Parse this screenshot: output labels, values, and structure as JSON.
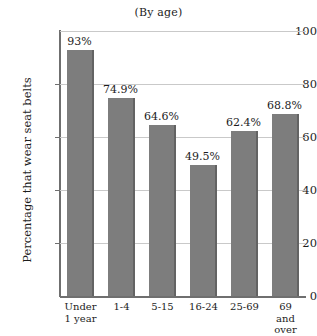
{
  "chart_data": {
    "type": "bar",
    "title": "(By age)",
    "xlabel": "",
    "ylabel": "Percentage that wear seat belts",
    "ylim": [
      0,
      100
    ],
    "yticks": [
      "0",
      "20",
      "40",
      "60",
      "80",
      "100"
    ],
    "grid": true,
    "legend": "none",
    "bar_color": "#7d7d7d",
    "bar_edge_color": "#636363",
    "gridline_color": "#c9c9c9",
    "axis_color": "#6f6f6f",
    "background": "#ffffff",
    "categories": [
      "Under\n1 year",
      "1-4",
      "5-15",
      "16-24",
      "25-69",
      "69 and\nover"
    ],
    "values": [
      93,
      74.9,
      64.6,
      49.5,
      62.4,
      68.8
    ],
    "data_labels": [
      "93%",
      "74.9%",
      "64.6%",
      "49.5%",
      "62.4%",
      "68.8%"
    ]
  }
}
